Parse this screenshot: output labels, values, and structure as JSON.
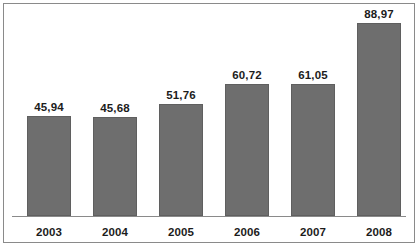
{
  "chart_data": {
    "type": "bar",
    "title": "",
    "subtitle": "",
    "xlabel": "",
    "ylabel": "",
    "categories": [
      "2003",
      "2004",
      "2005",
      "2006",
      "2007",
      "2008"
    ],
    "values": [
      45.94,
      45.68,
      51.76,
      60.72,
      61.05,
      88.97
    ],
    "value_labels": [
      "45,94",
      "45,68",
      "51,76",
      "60,72",
      "61,05",
      "88,97"
    ],
    "decimal_separator": ",",
    "series": [
      {
        "name": "",
        "values": [
          45.94,
          45.68,
          51.76,
          60.72,
          61.05,
          88.97
        ],
        "color": "#6e6e6e"
      }
    ],
    "ylim": [
      0,
      88.97
    ],
    "grid": false,
    "legend": false,
    "legend_position": "none",
    "axis_line": true,
    "bar_color": "#6e6e6e",
    "bar_border_color": "#5f5f5f",
    "label_color": "#1c1c1c",
    "frame_color": "#8a8a8a",
    "background": "#ffffff"
  }
}
